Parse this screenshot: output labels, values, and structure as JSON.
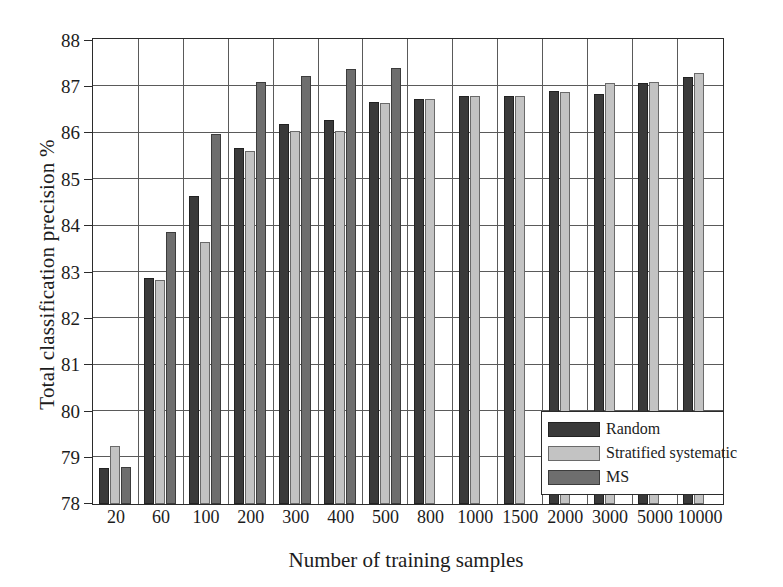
{
  "chart_data": {
    "type": "bar",
    "title": "",
    "xlabel": "Number of training samples",
    "ylabel": "Total classification precision %",
    "ylim": [
      78,
      88
    ],
    "ytick_step": 1,
    "yticks": [
      78,
      79,
      80,
      81,
      82,
      83,
      84,
      85,
      86,
      87,
      88
    ],
    "grid": true,
    "legend_position": "bottom-right",
    "categories": [
      "20",
      "60",
      "100",
      "200",
      "300",
      "400",
      "500",
      "800",
      "1000",
      "1500",
      "2000",
      "3000",
      "5000",
      "10000"
    ],
    "series": [
      {
        "name": "Random",
        "color": "#3a3a3a",
        "values": [
          78.78,
          82.88,
          84.65,
          85.68,
          86.2,
          86.28,
          86.67,
          86.73,
          86.79,
          86.8,
          86.91,
          86.85,
          87.08,
          87.21
        ]
      },
      {
        "name": "Stratified systematic",
        "color": "#c3c3c3",
        "values": [
          79.25,
          82.83,
          83.65,
          85.62,
          86.05,
          86.05,
          86.64,
          86.73,
          86.79,
          86.79,
          86.88,
          87.08,
          87.09,
          87.3
        ]
      },
      {
        "name": "MS",
        "color": "#6e6e6e",
        "values": [
          78.8,
          83.87,
          85.97,
          87.1,
          87.23,
          87.38,
          87.4,
          null,
          null,
          null,
          null,
          null,
          null,
          null
        ]
      }
    ]
  },
  "legend": {
    "items": [
      {
        "label": "Random",
        "swatch_class": "s0"
      },
      {
        "label": "Stratified systematic",
        "swatch_class": "s1"
      },
      {
        "label": "MS",
        "swatch_class": "s2"
      }
    ]
  },
  "axes": {
    "y_title": "Total classification precision %",
    "x_title": "Number of training samples"
  }
}
